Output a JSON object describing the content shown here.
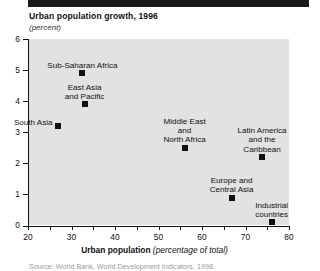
{
  "figure": {
    "title": "Urban population growth, 1996",
    "subtitle": "(percent)",
    "xaxis_title_bold": "Urban population",
    "xaxis_title_italic": "(percentage of total)",
    "source": "Source: World Bank, World Development Indicators, 1998."
  },
  "chart_data": {
    "type": "scatter",
    "title": "Urban population growth, 1996",
    "subtitle": "(percent)",
    "xlabel": "Urban population (percentage of total)",
    "ylabel": "(percent)",
    "xlim": [
      20,
      80
    ],
    "ylim": [
      0,
      6
    ],
    "xticks": [
      20,
      25,
      30,
      35,
      40,
      45,
      50,
      55,
      60,
      65,
      70,
      75,
      80
    ],
    "xtick_labels": [
      "20",
      "",
      "30",
      "",
      "40",
      "",
      "50",
      "",
      "60",
      "",
      "70",
      "",
      "80"
    ],
    "yticks": [
      0,
      1,
      2,
      3,
      4,
      5,
      6
    ],
    "ytick_labels": [
      "0",
      "1",
      "2",
      "3",
      "4",
      "5",
      "6"
    ],
    "grid": false,
    "legend": "none",
    "marker_color": "#111111",
    "plot_background": "#e2e2e2",
    "points": [
      {
        "label": "Sub-Saharan Africa",
        "x": 32.5,
        "y": 4.9,
        "label_lines": [
          "Sub-Saharan Africa"
        ],
        "label_pos": "above"
      },
      {
        "label": "East Asia and Pacific",
        "x": 33.0,
        "y": 3.9,
        "label_lines": [
          "East Asia",
          "and Pacific"
        ],
        "label_pos": "above"
      },
      {
        "label": "South Asia",
        "x": 26.8,
        "y": 3.2,
        "label_lines": [
          "South Asia"
        ],
        "label_pos": "above-left"
      },
      {
        "label": "Middle East and North Africa",
        "x": 56.0,
        "y": 2.5,
        "label_lines": [
          "Middle East",
          "and",
          "North Africa"
        ],
        "label_pos": "above"
      },
      {
        "label": "Latin America and the Caribbean",
        "x": 73.8,
        "y": 2.2,
        "label_lines": [
          "Latin America",
          "and the",
          "Caribbean"
        ],
        "label_pos": "above"
      },
      {
        "label": "Europe and Central Asia",
        "x": 66.8,
        "y": 0.9,
        "label_lines": [
          "Europe and",
          "Central Asia"
        ],
        "label_pos": "above"
      },
      {
        "label": "Industrial countries",
        "x": 76.0,
        "y": 0.1,
        "label_lines": [
          "Industrial",
          "countries"
        ],
        "label_pos": "above"
      }
    ]
  }
}
